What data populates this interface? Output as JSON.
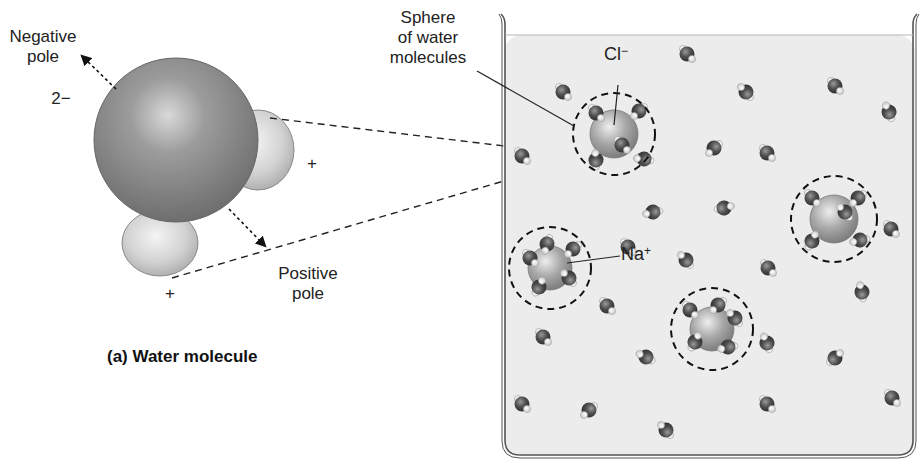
{
  "figure": {
    "part_a": {
      "caption": "(a) Water molecule",
      "labels": {
        "negative_pole": "Negative\npole",
        "negative_pole_line1": "Negative",
        "negative_pole_line2": "pole",
        "charge_oxygen": "2−",
        "charge_hydrogen_top": "+",
        "charge_hydrogen_bottom": "+",
        "positive_pole_line1": "Positive",
        "positive_pole_line2": "pole"
      }
    },
    "part_b": {
      "labels": {
        "sphere_line1": "Sphere",
        "sphere_line2": "of water",
        "sphere_line3": "molecules",
        "chloride": "Cl",
        "chloride_charge": "−",
        "sodium": "Na",
        "sodium_charge": "+"
      },
      "hydrated_ions": [
        {
          "ion": "Cl-",
          "cx": 614,
          "cy": 134
        },
        {
          "ion": "Na+",
          "cx": 550,
          "cy": 268
        },
        {
          "ion": "ion",
          "cx": 834,
          "cy": 219
        },
        {
          "ion": "ion",
          "cx": 712,
          "cy": 329
        }
      ]
    },
    "colors": {
      "oxygen": "#555555",
      "hydrogen": "#dcdcdc",
      "ion": "#9a9a9a",
      "water_bg": "#ececec",
      "ink": "#222222"
    }
  }
}
